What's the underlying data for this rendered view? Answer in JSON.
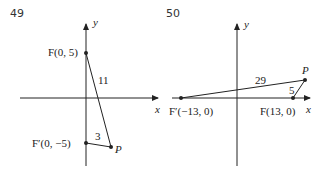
{
  "panels": [
    {
      "number": "49",
      "axis_x_label": "x",
      "axis_y_label": "y",
      "points": {
        "F": "F(0, 5)",
        "F_prime": "F′(0, −5)",
        "P": "P"
      },
      "distances": {
        "PF": "11",
        "PF_prime": "3"
      }
    },
    {
      "number": "50",
      "axis_x_label": "x",
      "axis_y_label": "y",
      "points": {
        "F": "F(13, 0)",
        "F_prime": "F′(−13, 0)",
        "P": "P"
      },
      "distances": {
        "PF_prime": "29",
        "PF": "5"
      }
    }
  ],
  "colors": {
    "line": "#222222",
    "background": "#ffffff"
  }
}
